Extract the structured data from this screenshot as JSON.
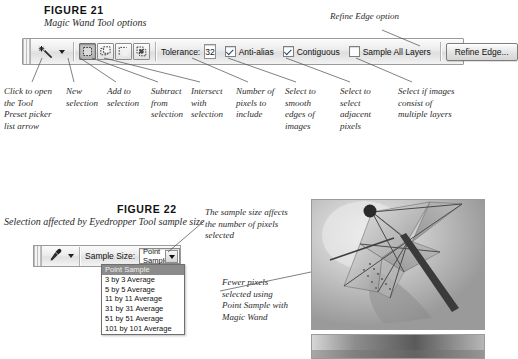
{
  "figure21": {
    "label": "FIGURE 21",
    "caption": "Magic Wand Tool options",
    "refine_note": "Refine Edge option",
    "options_bar": {
      "tool_icon": "magic-wand-icon",
      "tool_preset_arrow": "chevron-down-icon",
      "selection_modes": [
        {
          "name": "new-selection",
          "state": "active"
        },
        {
          "name": "add-to-selection",
          "state": "normal"
        },
        {
          "name": "subtract-from-selection",
          "state": "normal"
        },
        {
          "name": "intersect-with-selection",
          "state": "normal"
        }
      ],
      "tolerance_label": "Tolerance:",
      "tolerance_value": "32",
      "anti_alias_label": "Anti-alias",
      "anti_alias_checked": true,
      "contiguous_label": "Contiguous",
      "contiguous_checked": true,
      "sample_all_layers_label": "Sample All Layers",
      "sample_all_layers_checked": false,
      "refine_edge_label": "Refine Edge..."
    },
    "callouts": [
      "Click to open\nthe Tool\nPreset picker\nlist arrow",
      "New\nselection",
      "Add to\nselection",
      "Subtract\nfrom\nselection",
      "Intersect\nwith\nselection",
      "Number of\npixels to\ninclude",
      "Select to\nsmooth\nedges of\nimages",
      "Select to\nselect\nadjacent\npixels",
      "Select if images\nconsist of\nmultiple layers"
    ],
    "callout_lines": [
      "Click to open the Tool Preset picker list arrow",
      "New selection",
      "Add to selection",
      "Subtract from selection",
      "Intersect with selection",
      "Number of pixels to include",
      "Select to smooth edges of images",
      "Select to select adjacent pixels",
      "Select if images consist of multiple layers"
    ]
  },
  "figure22": {
    "label": "FIGURE 22",
    "caption": "Selection affected by Eyedropper Tool sample size",
    "sample_size_note": "The sample size affects the number of pixels selected",
    "fewer_pixels_note": "Fewer pixels selected using Point Sample with Magic Wand",
    "options_bar": {
      "tool_icon": "eyedropper-icon",
      "tool_preset_arrow": "chevron-down-icon",
      "sample_size_label": "Sample Size:",
      "sample_size_value": "Point Sample",
      "dropdown_arrow": "chevron-down-icon"
    },
    "dropdown_options": [
      "Point Sample",
      "3 by 3 Average",
      "5 by 5 Average",
      "11 by 11 Average",
      "31 by 31 Average",
      "51 by 51 Average",
      "101 by 101 Average"
    ],
    "dropdown_selected": "Point Sample",
    "photo_main": "grayscale-cocktail-umbrella-photo",
    "photo_strip": "grayscale-photo-strip"
  },
  "colors": {
    "page_bg": "#ffffff",
    "text": "#1a1a1a",
    "bar_border": "#9a9a9a",
    "leader_line": "#4a4a4a",
    "dropdown_highlight": "#8b8b8b"
  }
}
